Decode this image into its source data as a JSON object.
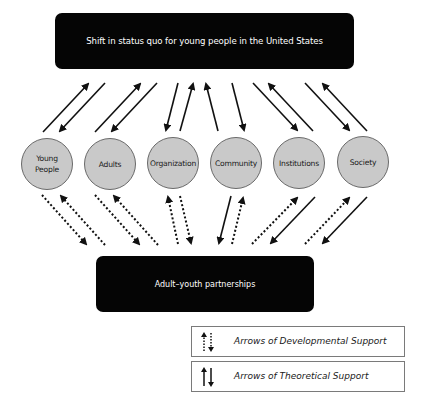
{
  "diagram": {
    "top_box": {
      "label": "Shift in status quo for young people in the United States"
    },
    "bottom_box": {
      "label": "Adult–youth partnerships"
    },
    "nodes": [
      {
        "label_line1": "Young",
        "label_line2": "People"
      },
      {
        "label_line1": "Adults",
        "label_line2": ""
      },
      {
        "label_line1": "Organization",
        "label_line2": ""
      },
      {
        "label_line1": "Community",
        "label_line2": ""
      },
      {
        "label_line1": "Institutions",
        "label_line2": ""
      },
      {
        "label_line1": "Society",
        "label_line2": ""
      }
    ],
    "legend": [
      {
        "icon": "dotted-bidirectional-arrows-icon",
        "label": "Arrows of Developmental Support"
      },
      {
        "icon": "solid-bidirectional-arrows-icon",
        "label": "Arrows of Theoretical Support"
      }
    ],
    "colors": {
      "box_fill": "#050505",
      "node_fill": "#c9c9c9",
      "node_border": "#6a6a6a",
      "arrow": "#111111"
    }
  }
}
